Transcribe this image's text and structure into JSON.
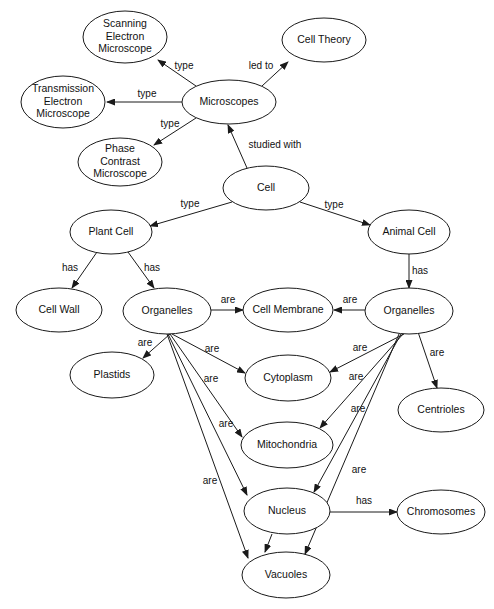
{
  "diagram": {
    "type": "concept-map",
    "background_color": "#ffffff",
    "node_fill": "#ffffff",
    "node_stroke": "#1a1a1a",
    "text_color": "#111111",
    "nodes": [
      {
        "id": "scanning",
        "label": "Scanning Electron Microscope",
        "lines": [
          "Scanning",
          "Electron",
          "Microscope"
        ],
        "cx": 125,
        "cy": 37,
        "rx": 42,
        "ry": 26
      },
      {
        "id": "celltheory",
        "label": "Cell Theory",
        "lines": [
          "Cell Theory"
        ],
        "cx": 324,
        "cy": 40,
        "rx": 42,
        "ry": 22
      },
      {
        "id": "transmission",
        "label": "Transmission Electron Microscope",
        "lines": [
          "Transmission",
          "Electron",
          "Microscope"
        ],
        "cx": 63,
        "cy": 102,
        "rx": 42,
        "ry": 26
      },
      {
        "id": "microscopes",
        "label": "Microscopes",
        "lines": [
          "Microscopes"
        ],
        "cx": 229,
        "cy": 102,
        "rx": 47,
        "ry": 22
      },
      {
        "id": "phase",
        "label": "Phase Contrast Microscope",
        "lines": [
          "Phase",
          "Contrast",
          "Microscope"
        ],
        "cx": 120,
        "cy": 162,
        "rx": 42,
        "ry": 24
      },
      {
        "id": "cell",
        "label": "Cell",
        "lines": [
          "Cell"
        ],
        "cx": 266,
        "cy": 188,
        "rx": 43,
        "ry": 22
      },
      {
        "id": "plantcell",
        "label": "Plant Cell",
        "lines": [
          "Plant Cell"
        ],
        "cx": 111,
        "cy": 232,
        "rx": 41,
        "ry": 22
      },
      {
        "id": "animalcell",
        "label": "Animal Cell",
        "lines": [
          "Animal Cell"
        ],
        "cx": 409,
        "cy": 232,
        "rx": 41,
        "ry": 22
      },
      {
        "id": "cellwall",
        "label": "Cell Wall",
        "lines": [
          "Cell Wall"
        ],
        "cx": 59,
        "cy": 310,
        "rx": 43,
        "ry": 22
      },
      {
        "id": "organelles_p",
        "label": "Organelles",
        "lines": [
          "Organelles"
        ],
        "cx": 167,
        "cy": 311,
        "rx": 44,
        "ry": 23
      },
      {
        "id": "cellmembrane",
        "label": "Cell Membrane",
        "lines": [
          "Cell Membrane"
        ],
        "cx": 288,
        "cy": 310,
        "rx": 45,
        "ry": 22
      },
      {
        "id": "organelles_a",
        "label": "Organelles",
        "lines": [
          "Organelles"
        ],
        "cx": 409,
        "cy": 311,
        "rx": 44,
        "ry": 23
      },
      {
        "id": "plastids",
        "label": "Plastids",
        "lines": [
          "Plastids"
        ],
        "cx": 112,
        "cy": 375,
        "rx": 42,
        "ry": 23
      },
      {
        "id": "cytoplasm",
        "label": "Cytoplasm",
        "lines": [
          "Cytoplasm"
        ],
        "cx": 288,
        "cy": 378,
        "rx": 43,
        "ry": 23
      },
      {
        "id": "centrioles",
        "label": "Centrioles",
        "lines": [
          "Centrioles"
        ],
        "cx": 441,
        "cy": 410,
        "rx": 43,
        "ry": 22
      },
      {
        "id": "mitochondria",
        "label": "Mitochondria",
        "lines": [
          "Mitochondria"
        ],
        "cx": 287,
        "cy": 445,
        "rx": 46,
        "ry": 23
      },
      {
        "id": "nucleus",
        "label": "Nucleus",
        "lines": [
          "Nucleus"
        ],
        "cx": 287,
        "cy": 511,
        "rx": 43,
        "ry": 23
      },
      {
        "id": "chromosomes",
        "label": "Chromosomes",
        "lines": [
          "Chromosomes"
        ],
        "cx": 441,
        "cy": 512,
        "rx": 44,
        "ry": 22
      },
      {
        "id": "vacuoles",
        "label": "Vacuoles",
        "lines": [
          "Vacuoles"
        ],
        "cx": 286,
        "cy": 575,
        "rx": 44,
        "ry": 23
      }
    ],
    "edges": [
      {
        "from": "microscopes",
        "to": "scanning",
        "label": "type",
        "x1": 196,
        "y1": 86,
        "x2": 158,
        "y2": 60,
        "lx": 184,
        "ly": 66
      },
      {
        "from": "microscopes",
        "to": "celltheory",
        "label": "led to",
        "x1": 262,
        "y1": 86,
        "x2": 288,
        "y2": 62,
        "lx": 261,
        "ly": 66
      },
      {
        "from": "microscopes",
        "to": "transmission",
        "label": "type",
        "x1": 182,
        "y1": 102,
        "x2": 107,
        "y2": 102,
        "lx": 147,
        "ly": 94
      },
      {
        "from": "microscopes",
        "to": "phase",
        "label": "type",
        "x1": 196,
        "y1": 118,
        "x2": 154,
        "y2": 145,
        "lx": 170,
        "ly": 124
      },
      {
        "from": "cell",
        "to": "microscopes",
        "label": "studied with",
        "x1": 247,
        "y1": 168,
        "x2": 228,
        "y2": 125,
        "lx": 275,
        "ly": 145
      },
      {
        "from": "cell",
        "to": "plantcell",
        "label": "type",
        "x1": 232,
        "y1": 202,
        "x2": 150,
        "y2": 226,
        "lx": 190,
        "ly": 204
      },
      {
        "from": "cell",
        "to": "animalcell",
        "label": "type",
        "x1": 300,
        "y1": 202,
        "x2": 370,
        "y2": 225,
        "lx": 334,
        "ly": 205
      },
      {
        "from": "plantcell",
        "to": "cellwall",
        "label": "has",
        "x1": 97,
        "y1": 252,
        "x2": 72,
        "y2": 288,
        "lx": 70,
        "ly": 268
      },
      {
        "from": "plantcell",
        "to": "organelles_p",
        "label": "has",
        "x1": 128,
        "y1": 252,
        "x2": 154,
        "y2": 288,
        "lx": 152,
        "ly": 268
      },
      {
        "from": "animalcell",
        "to": "organelles_a",
        "label": "has",
        "x1": 409,
        "y1": 254,
        "x2": 409,
        "y2": 288,
        "lx": 420,
        "ly": 271
      },
      {
        "from": "organelles_p",
        "to": "cellmembrane",
        "label": "are",
        "x1": 211,
        "y1": 310,
        "x2": 243,
        "y2": 310,
        "lx": 228,
        "ly": 300
      },
      {
        "from": "organelles_a",
        "to": "cellmembrane",
        "label": "are",
        "x1": 365,
        "y1": 310,
        "x2": 334,
        "y2": 310,
        "lx": 350,
        "ly": 300
      },
      {
        "from": "organelles_p",
        "to": "plastids",
        "label": "are",
        "x1": 170,
        "y1": 334,
        "x2": 143,
        "y2": 358,
        "lx": 145,
        "ly": 343
      },
      {
        "from": "organelles_p",
        "to": "cytoplasm",
        "label": "are",
        "x1": 172,
        "y1": 334,
        "x2": 245,
        "y2": 373,
        "lx": 212,
        "ly": 349
      },
      {
        "from": "organelles_p",
        "to": "mitochondria",
        "label": "are",
        "x1": 170,
        "y1": 334,
        "x2": 242,
        "y2": 437,
        "lx": 211,
        "ly": 379
      },
      {
        "from": "organelles_p",
        "to": "nucleus",
        "label": "are",
        "x1": 168,
        "y1": 334,
        "x2": 247,
        "y2": 495,
        "lx": 226,
        "ly": 424
      },
      {
        "from": "organelles_p",
        "to": "vacuoles",
        "label": "are",
        "x1": 167,
        "y1": 334,
        "x2": 248,
        "y2": 558,
        "lx": 210,
        "ly": 481
      },
      {
        "from": "organelles_a",
        "to": "cytoplasm",
        "label": "are",
        "x1": 404,
        "y1": 334,
        "x2": 330,
        "y2": 372,
        "lx": 360,
        "ly": 348
      },
      {
        "from": "organelles_a",
        "to": "centrioles",
        "label": "are",
        "x1": 418,
        "y1": 332,
        "x2": 437,
        "y2": 388,
        "lx": 437,
        "ly": 353
      },
      {
        "from": "organelles_a",
        "to": "mitochondria",
        "label": "are",
        "x1": 403,
        "y1": 334,
        "x2": 320,
        "y2": 428,
        "lx": 356,
        "ly": 377
      },
      {
        "from": "organelles_a",
        "to": "nucleus",
        "label": "are",
        "x1": 401,
        "y1": 334,
        "x2": 314,
        "y2": 492,
        "lx": 358,
        "ly": 409
      },
      {
        "from": "organelles_a",
        "to": "vacuoles",
        "label": "are",
        "x1": 399,
        "y1": 334,
        "x2": 305,
        "y2": 554,
        "lx": 359,
        "ly": 470
      },
      {
        "from": "nucleus",
        "to": "chromosomes",
        "label": "has",
        "x1": 330,
        "y1": 512,
        "x2": 397,
        "y2": 512,
        "lx": 364,
        "ly": 501
      },
      {
        "from": "nucleus",
        "to": "vacuoles",
        "label": "",
        "x1": 272,
        "y1": 534,
        "x2": 265,
        "y2": 552,
        "lx": 0,
        "ly": 0
      }
    ]
  }
}
